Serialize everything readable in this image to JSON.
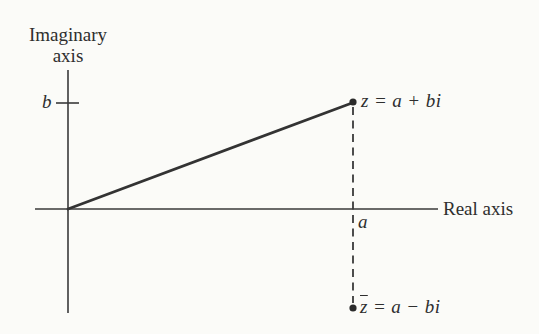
{
  "figure": {
    "imaginary_axis": {
      "line1": "Imaginary",
      "line2": "axis"
    },
    "real_axis_label": "Real axis",
    "b_tick_label": "b",
    "a_tick_label": "a",
    "z_point_label": "z = a + bi",
    "z_conjugate_label": {
      "base": "z",
      "rest": " = a − bi"
    }
  },
  "colors": {
    "ink": "#2e2e2e",
    "line": "#3a3a3a",
    "paper": "#fbfbf8"
  }
}
